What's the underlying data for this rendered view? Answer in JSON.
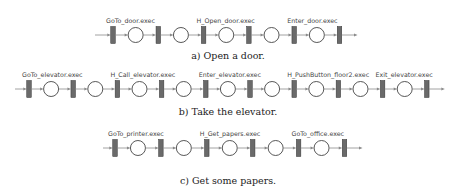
{
  "figures": [
    {
      "id": "a",
      "caption": "a) Open a door.",
      "transitions": 6,
      "labels": [
        {
          "text": "GoTo_door.exec",
          "between": 0
        },
        {
          "text": "H_Open_door.exec",
          "between": 2
        },
        {
          "text": "Enter_door.exec",
          "between": 4
        }
      ]
    },
    {
      "id": "b",
      "caption": "b) Take the elevator.",
      "transitions": 10,
      "labels": [
        {
          "text": "GoTo_elevator.exec",
          "between": 0
        },
        {
          "text": "H_Call_elevator.exec",
          "between": 2
        },
        {
          "text": "Enter_elevator.exec",
          "between": 4
        },
        {
          "text": "H_PushButton_floor2.exec",
          "between": 6
        },
        {
          "text": "Exit_elevator.exec",
          "between": 8
        }
      ]
    },
    {
      "id": "c",
      "caption": "c) Get some papers.",
      "transitions": 6,
      "labels": [
        {
          "text": "GoTo_printer.exec",
          "between": 0
        },
        {
          "text": "H_Get_papers.exec",
          "between": 2
        },
        {
          "text": "GoTo_office.exec",
          "between": 4
        }
      ]
    }
  ]
}
